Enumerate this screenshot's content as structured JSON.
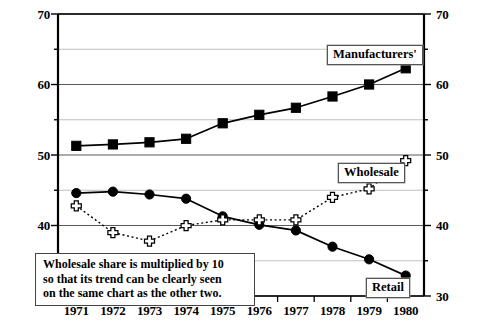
{
  "chart_data": {
    "type": "line",
    "title": "",
    "xlabel": "",
    "ylabel": "",
    "categories": [
      "1971",
      "1972",
      "1973",
      "1974",
      "1975",
      "1976",
      "1977",
      "1978",
      "1979",
      "1980"
    ],
    "x": [
      1971,
      1972,
      1973,
      1974,
      1975,
      1976,
      1977,
      1978,
      1979,
      1980
    ],
    "ylim": [
      30,
      70
    ],
    "ylim_right": [
      30,
      70
    ],
    "y_major_ticks": [
      30,
      40,
      50,
      60,
      70
    ],
    "y_minor_ticks": [
      35,
      45,
      55,
      65
    ],
    "grid": true,
    "legend_position": "inline-labels",
    "series": [
      {
        "name": "Manufacturers'",
        "marker": "filled-square",
        "line": "solid",
        "values": [
          51.3,
          51.5,
          51.8,
          52.3,
          54.5,
          55.7,
          56.7,
          58.3,
          60.0,
          62.3
        ]
      },
      {
        "name": "Retail",
        "marker": "filled-circle",
        "line": "solid",
        "values": [
          44.6,
          44.8,
          44.4,
          43.8,
          41.3,
          40.1,
          39.3,
          37.0,
          35.2,
          32.9
        ]
      },
      {
        "name": "Wholesale",
        "marker": "hollow-cross",
        "line": "dotted",
        "values": [
          42.8,
          39.0,
          37.8,
          40.0,
          40.8,
          40.8,
          40.8,
          44.0,
          45.2,
          49.2
        ]
      }
    ],
    "annotations": [
      {
        "name": "wholesale-note",
        "text": "Wholesale share is multiplied by 10\nso that its trend can be clearly seen\non the same chart as the other two."
      }
    ]
  },
  "axis": {
    "left_tick_labels": [
      "70",
      "60",
      "50",
      "40",
      "30"
    ],
    "right_tick_labels": [
      "70",
      "60",
      "50",
      "40",
      "30"
    ],
    "x_tick_labels": [
      "1971",
      "1972",
      "1973",
      "1974",
      "1975",
      "1976",
      "1977",
      "1978",
      "1979",
      "1980"
    ]
  },
  "labels": {
    "manufacturers": "Manufacturers'",
    "wholesale": "Wholesale",
    "retail": "Retail"
  },
  "annotation": {
    "text": "Wholesale share is multiplied by 10\nso that its trend can be clearly seen\non the same chart as the other two."
  },
  "colors": {
    "ink": "#000000",
    "grid_major": "#5a5a5a",
    "grid_minor": "#c0c0c0",
    "background": "#ffffff"
  }
}
